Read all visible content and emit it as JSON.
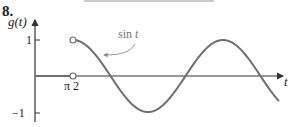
{
  "problem_number": "8.",
  "chart_data": {
    "type": "line",
    "title": "",
    "xlabel": "t",
    "ylabel": "g(t)",
    "ylim": [
      -1,
      1
    ],
    "yticks": [
      1,
      -1
    ],
    "ytick_labels": [
      "1",
      "−1"
    ],
    "xtick_labels": [
      "π 2"
    ],
    "grid": false,
    "legend": null,
    "annotations": [
      {
        "text": "sin t",
        "points_to": "curve near t≈3π/4, arrow"
      }
    ],
    "series": [
      {
        "name": "g(t) for t < π/2",
        "definition": "0",
        "x": [
          0,
          1.5708
        ],
        "y": [
          0,
          0
        ],
        "endpoint": "open circle at (π/2, 0)"
      },
      {
        "name": "sin t",
        "definition": "sin t for t > π/2",
        "x": [
          1.5708,
          3.1416,
          4.7124,
          6.2832,
          7.854,
          9.4248,
          10.2
        ],
        "y": [
          1,
          0,
          -1,
          0,
          1,
          0,
          -0.7
        ],
        "endpoint": "open circle at (π/2, 1)"
      }
    ]
  },
  "labels": {
    "y_axis": "g(t)",
    "x_axis": "t",
    "y_tick_pos": "1",
    "y_tick_neg": "−1",
    "x_tick": "π 2",
    "curve_name": "sin",
    "curve_var": "t"
  },
  "colors": {
    "axis": "#333333",
    "curve": "#6e6e6e",
    "annotation": "#8a8a8a"
  }
}
